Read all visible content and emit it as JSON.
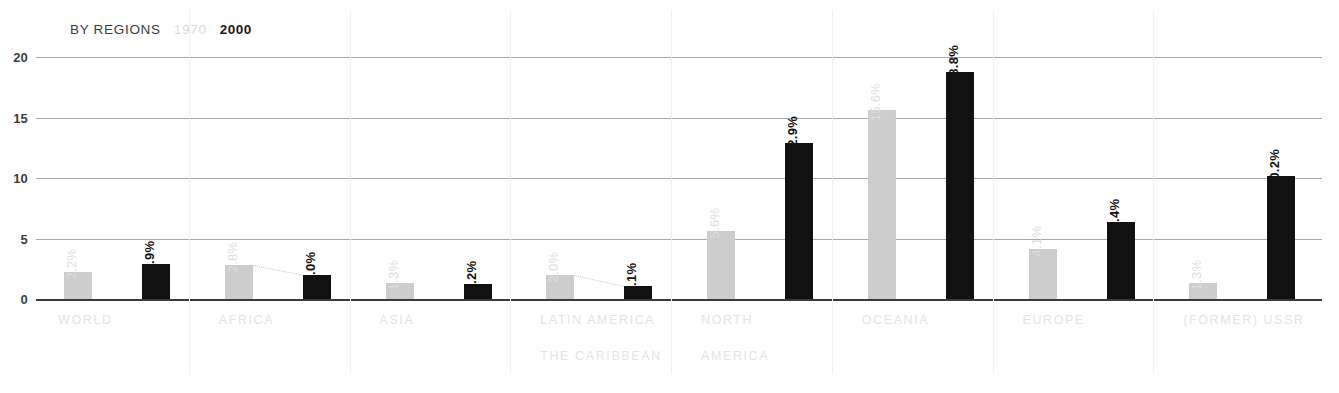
{
  "legend": {
    "title": "BY REGIONS",
    "series_old": "1970",
    "series_new": "2000"
  },
  "axis": {
    "y_ticks": [
      "20",
      "15",
      "10",
      "5",
      "0"
    ]
  },
  "colors": {
    "series_old": "#cdcdcd",
    "series_new": "#111111",
    "gridline": "#a9a9a9",
    "baseline": "#3b3b3b",
    "category_label": "#e4e4e4"
  },
  "chart_data": {
    "type": "bar",
    "title": "BY REGIONS",
    "xlabel": "",
    "ylabel": "",
    "ylim": [
      0,
      20
    ],
    "yticks": [
      0,
      5,
      10,
      15,
      20
    ],
    "grid": true,
    "legend_position": "top-left",
    "categories": [
      "WORLD",
      "AFRICA",
      "ASIA",
      "LATIN AMERICA THE CARIBBEAN",
      "NORTH AMERICA",
      "OCEANIA",
      "EUROPE",
      "(FORMER) USSR"
    ],
    "series": [
      {
        "name": "1970",
        "values": [
          2.2,
          2.8,
          1.3,
          2.0,
          5.6,
          15.6,
          4.1,
          1.3
        ],
        "labels": [
          "2.2%",
          "2.8%",
          "1.3%",
          "2.0%",
          "5.6%",
          "15.6%",
          "4.1%",
          "1.3%"
        ]
      },
      {
        "name": "2000",
        "values": [
          2.9,
          2.0,
          1.2,
          1.1,
          12.9,
          18.8,
          6.4,
          10.2
        ],
        "labels": [
          "2.9%",
          "2.0%",
          "1.2%",
          "1.1%",
          "12.9%",
          "18.8%",
          "6.4%",
          "10.2%"
        ]
      }
    ]
  },
  "groups": [
    {
      "label_line1": "WORLD",
      "label_line2": "",
      "old": {
        "value": 2.2,
        "label": "2.2%"
      },
      "new": {
        "value": 2.9,
        "label": "2.9%"
      }
    },
    {
      "label_line1": "AFRICA",
      "label_line2": "",
      "old": {
        "value": 2.8,
        "label": "2.8%"
      },
      "new": {
        "value": 2.0,
        "label": "2.0%"
      }
    },
    {
      "label_line1": "ASIA",
      "label_line2": "",
      "old": {
        "value": 1.3,
        "label": "1.3%"
      },
      "new": {
        "value": 1.2,
        "label": "1.2%"
      }
    },
    {
      "label_line1": "LATIN AMERICA",
      "label_line2": "THE CARIBBEAN",
      "old": {
        "value": 2.0,
        "label": "2.0%"
      },
      "new": {
        "value": 1.1,
        "label": "1.1%"
      }
    },
    {
      "label_line1": "NORTH",
      "label_line2": "AMERICA",
      "old": {
        "value": 5.6,
        "label": "5.6%"
      },
      "new": {
        "value": 12.9,
        "label": "12.9%"
      }
    },
    {
      "label_line1": "OCEANIA",
      "label_line2": "",
      "old": {
        "value": 15.6,
        "label": "15.6%"
      },
      "new": {
        "value": 18.8,
        "label": "18.8%"
      }
    },
    {
      "label_line1": "EUROPE",
      "label_line2": "",
      "old": {
        "value": 4.1,
        "label": "4.1%"
      },
      "new": {
        "value": 6.4,
        "label": "6.4%"
      }
    },
    {
      "label_line1": "(FORMER) USSR",
      "label_line2": "",
      "old": {
        "value": 1.3,
        "label": "1.3%"
      },
      "new": {
        "value": 10.2,
        "label": "10.2%"
      }
    }
  ]
}
